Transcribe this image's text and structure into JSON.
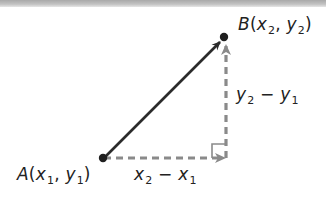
{
  "diagram": {
    "type": "coordinate-distance-diagram",
    "points": {
      "A": {
        "name": "A",
        "label": "A(x₁, y₁)",
        "x_sub": "1",
        "y_sub": "1"
      },
      "B": {
        "name": "B",
        "label": "B(x₂, y₂)",
        "x_sub": "2",
        "y_sub": "2"
      }
    },
    "segments": [
      {
        "from": "A",
        "to": "B",
        "style": "solid",
        "arrow": "end",
        "color": "#2b2b2b"
      },
      {
        "from": "A",
        "to": "C",
        "style": "dashed",
        "arrow": "end",
        "color": "#8a8a8a",
        "label": "x₂ − x₁"
      },
      {
        "from": "C",
        "to": "B",
        "style": "dashed",
        "arrow": "end",
        "color": "#8a8a8a",
        "label": "y₂ − y₁"
      }
    ],
    "right_angle_marker": true,
    "labels": {
      "horizontal_diff": "x₂ − x₁",
      "vertical_diff": "y₂ − y₁"
    },
    "colors": {
      "solid_vector": "#2b2b2b",
      "dashed_components": "#8a8a8a",
      "text": "#222222"
    }
  },
  "text": {
    "A_letter": "A",
    "B_letter": "B",
    "open": "(",
    "close": ")",
    "comma": ", ",
    "x": "x",
    "y": "y",
    "one": "1",
    "two": "2",
    "minus": " − "
  }
}
